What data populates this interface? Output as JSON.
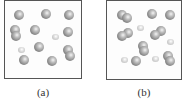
{
  "figure": {
    "panels": [
      {
        "id": "a",
        "label": "(a)",
        "box": {
          "x": 4,
          "y": 0,
          "w": 78,
          "h": 79
        },
        "particles": [
          {
            "type": "big",
            "x": 14,
            "y": 10
          },
          {
            "type": "big",
            "x": 41,
            "y": 9
          },
          {
            "type": "big",
            "x": 64,
            "y": 10
          },
          {
            "type": "big",
            "x": 10,
            "y": 25
          },
          {
            "type": "big",
            "x": 11,
            "y": 31
          },
          {
            "type": "big",
            "x": 30,
            "y": 25
          },
          {
            "type": "small",
            "x": 52,
            "y": 34
          },
          {
            "type": "big",
            "x": 63,
            "y": 27
          },
          {
            "type": "big",
            "x": 34,
            "y": 42
          },
          {
            "type": "small",
            "x": 18,
            "y": 47
          },
          {
            "type": "big",
            "x": 63,
            "y": 45
          },
          {
            "type": "big",
            "x": 65,
            "y": 51
          },
          {
            "type": "big",
            "x": 19,
            "y": 55
          },
          {
            "type": "big",
            "x": 47,
            "y": 56
          }
        ]
      },
      {
        "id": "b",
        "label": "(b)",
        "box": {
          "x": 106,
          "y": 0,
          "w": 76,
          "h": 80
        },
        "particles": [
          {
            "type": "big",
            "x": 117,
            "y": 10
          },
          {
            "type": "big",
            "x": 122,
            "y": 13
          },
          {
            "type": "big",
            "x": 147,
            "y": 9
          },
          {
            "type": "big",
            "x": 165,
            "y": 10
          },
          {
            "type": "small",
            "x": 137,
            "y": 25
          },
          {
            "type": "big",
            "x": 123,
            "y": 28
          },
          {
            "type": "big",
            "x": 117,
            "y": 31
          },
          {
            "type": "big",
            "x": 156,
            "y": 26
          },
          {
            "type": "big",
            "x": 150,
            "y": 30
          },
          {
            "type": "small",
            "x": 167,
            "y": 39
          },
          {
            "type": "big",
            "x": 138,
            "y": 41
          },
          {
            "type": "big",
            "x": 139,
            "y": 46
          },
          {
            "type": "small",
            "x": 121,
            "y": 57
          },
          {
            "type": "big",
            "x": 131,
            "y": 56
          },
          {
            "type": "small",
            "x": 152,
            "y": 56
          },
          {
            "type": "big",
            "x": 163,
            "y": 51
          },
          {
            "type": "big",
            "x": 165,
            "y": 56
          }
        ]
      }
    ]
  }
}
